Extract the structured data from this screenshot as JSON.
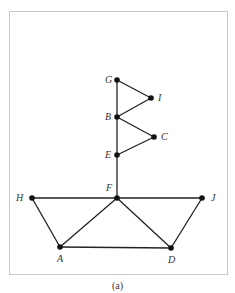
{
  "diagram": {
    "caption": "(a)",
    "colors": {
      "edge": "#222222",
      "node": "#111111",
      "border": "#c8c8c8",
      "label": "#333333"
    },
    "nodes": [
      {
        "id": "G",
        "label": "G",
        "x": 117,
        "y": 80
      },
      {
        "id": "I",
        "label": "I",
        "x": 151,
        "y": 98
      },
      {
        "id": "B",
        "label": "B",
        "x": 117,
        "y": 117
      },
      {
        "id": "C",
        "label": "C",
        "x": 154,
        "y": 137
      },
      {
        "id": "E",
        "label": "E",
        "x": 117,
        "y": 155
      },
      {
        "id": "F",
        "label": "F",
        "x": 117,
        "y": 198
      },
      {
        "id": "H",
        "label": "H",
        "x": 32,
        "y": 198
      },
      {
        "id": "J",
        "label": "J",
        "x": 202,
        "y": 198
      },
      {
        "id": "A",
        "label": "A",
        "x": 60,
        "y": 247
      },
      {
        "id": "D",
        "label": "D",
        "x": 171,
        "y": 248
      }
    ],
    "edges": [
      [
        "G",
        "I"
      ],
      [
        "I",
        "B"
      ],
      [
        "G",
        "B"
      ],
      [
        "B",
        "C"
      ],
      [
        "C",
        "E"
      ],
      [
        "B",
        "E"
      ],
      [
        "E",
        "F"
      ],
      [
        "H",
        "F"
      ],
      [
        "F",
        "J"
      ],
      [
        "H",
        "A"
      ],
      [
        "F",
        "A"
      ],
      [
        "F",
        "D"
      ],
      [
        "J",
        "D"
      ],
      [
        "A",
        "D"
      ]
    ]
  }
}
